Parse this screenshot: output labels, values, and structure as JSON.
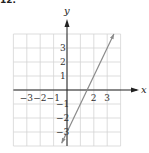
{
  "figure_label": "12.",
  "chart_data": {
    "type": "line",
    "title": "",
    "xlabel": "x",
    "ylabel": "y",
    "xlim": [
      -4,
      4
    ],
    "ylim": [
      -4,
      4
    ],
    "grid": true,
    "x_ticks": [
      "-3",
      "-2",
      "-1",
      "2",
      "3"
    ],
    "y_ticks": [
      "3",
      "2",
      "1",
      "-1",
      "-2",
      "-3"
    ],
    "series": [
      {
        "name": "y = 2x - 3",
        "x": [
          -0.4,
          3.5
        ],
        "y": [
          -3.8,
          4.0
        ],
        "equation": "y = 2x - 3"
      }
    ],
    "colors": {
      "line": "#8a8a8a",
      "grid": "#d4d4d4",
      "axis": "#222222"
    }
  }
}
